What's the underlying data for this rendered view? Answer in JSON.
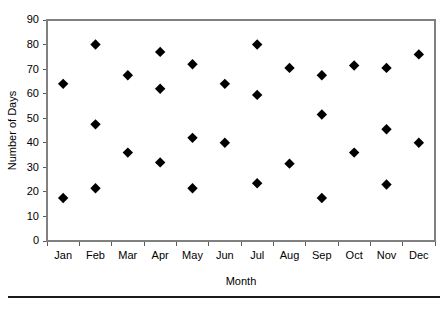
{
  "chart_data": {
    "type": "scatter",
    "title": "",
    "xlabel": "Month",
    "ylabel": "Number of Days",
    "categories": [
      "Jan",
      "Feb",
      "Mar",
      "Apr",
      "May",
      "Jun",
      "Jul",
      "Aug",
      "Sep",
      "Oct",
      "Nov",
      "Dec"
    ],
    "ylim": [
      0,
      90
    ],
    "ytick_labels": [
      "0",
      "10",
      "20",
      "30",
      "40",
      "50",
      "60",
      "70",
      "80",
      "90"
    ],
    "yticks": [
      0,
      10,
      20,
      30,
      40,
      50,
      60,
      70,
      80,
      90
    ],
    "grid": false,
    "legend": false,
    "marker": "diamond",
    "marker_color": "#000000",
    "points": [
      {
        "category": "Jan",
        "values": [
          64,
          17.5
        ]
      },
      {
        "category": "Feb",
        "values": [
          80,
          47.5,
          21.5
        ]
      },
      {
        "category": "Mar",
        "values": [
          67.5,
          36
        ]
      },
      {
        "category": "Apr",
        "values": [
          77,
          62,
          32
        ]
      },
      {
        "category": "May",
        "values": [
          72,
          42,
          21.5
        ]
      },
      {
        "category": "Jun",
        "values": [
          64,
          40
        ]
      },
      {
        "category": "Jul",
        "values": [
          80,
          59.5,
          23.5
        ]
      },
      {
        "category": "Aug",
        "values": [
          70.5,
          31.5
        ]
      },
      {
        "category": "Sep",
        "values": [
          67.5,
          51.5,
          17.5
        ]
      },
      {
        "category": "Oct",
        "values": [
          71.5,
          36
        ]
      },
      {
        "category": "Nov",
        "values": [
          70.5,
          45.5,
          23
        ]
      },
      {
        "category": "Dec",
        "values": [
          76,
          40
        ]
      }
    ]
  },
  "figure": {
    "footer_rule_visible": true
  }
}
